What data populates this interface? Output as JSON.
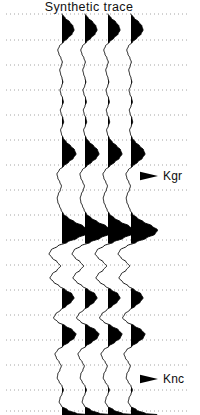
{
  "figure": {
    "width": 200,
    "height": 415,
    "background": "#ffffff",
    "ink": "#000000"
  },
  "title": {
    "text": "Synthetic trace"
  },
  "markers": [
    {
      "label": "Kgr",
      "y": 176,
      "label_x": 163,
      "arrow_tip_x": 158
    },
    {
      "label": "Knc",
      "y": 379,
      "label_x": 163,
      "arrow_tip_x": 158
    }
  ],
  "grid": {
    "style": "dotted",
    "color": "#9a9a9a",
    "x_start": 6,
    "x_end": 190,
    "dash": "1,3",
    "width": 0.9,
    "y_values": [
      14,
      40,
      65,
      90,
      115,
      140,
      165,
      190,
      215,
      240,
      265,
      290,
      315,
      340,
      365,
      390,
      411
    ]
  },
  "traces": {
    "count": 4,
    "baseline_x": [
      62,
      85,
      108,
      131
    ],
    "spacing": 23,
    "top": 14,
    "bottom": 415,
    "fill": "#000000",
    "stroke": "#000000",
    "stroke_width": 0.9,
    "gain": 1.0
  },
  "chart_data": {
    "type": "line",
    "title": "Synthetic trace",
    "xlabel": "",
    "ylabel": "",
    "display": "wiggle-variable-area",
    "n_traces": 4,
    "annotations": [
      "Kgr",
      "Knc"
    ],
    "t": [
      14,
      18,
      22,
      26,
      30,
      34,
      38,
      42,
      46,
      50,
      54,
      58,
      62,
      66,
      70,
      74,
      78,
      82,
      86,
      90,
      94,
      98,
      102,
      106,
      110,
      114,
      118,
      122,
      126,
      130,
      134,
      138,
      142,
      146,
      150,
      154,
      158,
      162,
      166,
      170,
      174,
      178,
      182,
      186,
      190,
      194,
      198,
      202,
      206,
      210,
      214,
      218,
      222,
      226,
      230,
      234,
      238,
      242,
      246,
      250,
      254,
      258,
      262,
      266,
      270,
      274,
      278,
      282,
      286,
      290,
      294,
      298,
      302,
      306,
      310,
      314,
      318,
      322,
      326,
      330,
      334,
      338,
      342,
      346,
      350,
      354,
      358,
      362,
      366,
      370,
      374,
      378,
      382,
      386,
      390,
      394,
      398,
      402,
      406,
      410,
      414
    ],
    "amplitude": [
      0.0,
      0.22,
      0.55,
      0.78,
      0.86,
      0.72,
      0.42,
      0.1,
      -0.18,
      -0.3,
      -0.22,
      -0.08,
      0.02,
      -0.06,
      -0.16,
      -0.1,
      0.0,
      0.06,
      -0.02,
      -0.14,
      -0.08,
      0.04,
      0.1,
      0.0,
      -0.12,
      -0.06,
      0.06,
      0.12,
      0.02,
      -0.1,
      -0.04,
      0.08,
      0.3,
      0.62,
      0.9,
      1.0,
      0.82,
      0.48,
      0.12,
      -0.2,
      -0.36,
      -0.3,
      -0.16,
      -0.04,
      -0.12,
      -0.26,
      -0.34,
      -0.3,
      -0.18,
      -0.06,
      0.1,
      0.44,
      0.9,
      1.5,
      1.9,
      1.72,
      1.1,
      0.4,
      -0.3,
      -0.78,
      -0.92,
      -0.7,
      -0.34,
      -0.1,
      -0.34,
      -0.7,
      -0.86,
      -0.6,
      -0.2,
      0.25,
      0.72,
      0.86,
      0.66,
      0.3,
      -0.1,
      -0.45,
      -0.6,
      -0.3,
      0.25,
      0.75,
      1.0,
      0.88,
      0.5,
      0.08,
      -0.32,
      -0.5,
      -0.4,
      -0.2,
      -0.05,
      -0.15,
      -0.3,
      -0.34,
      -0.2,
      0.0,
      0.1,
      0.0,
      -0.14,
      -0.2,
      -0.05,
      0.4,
      1.1,
      1.85
    ],
    "legend": []
  }
}
